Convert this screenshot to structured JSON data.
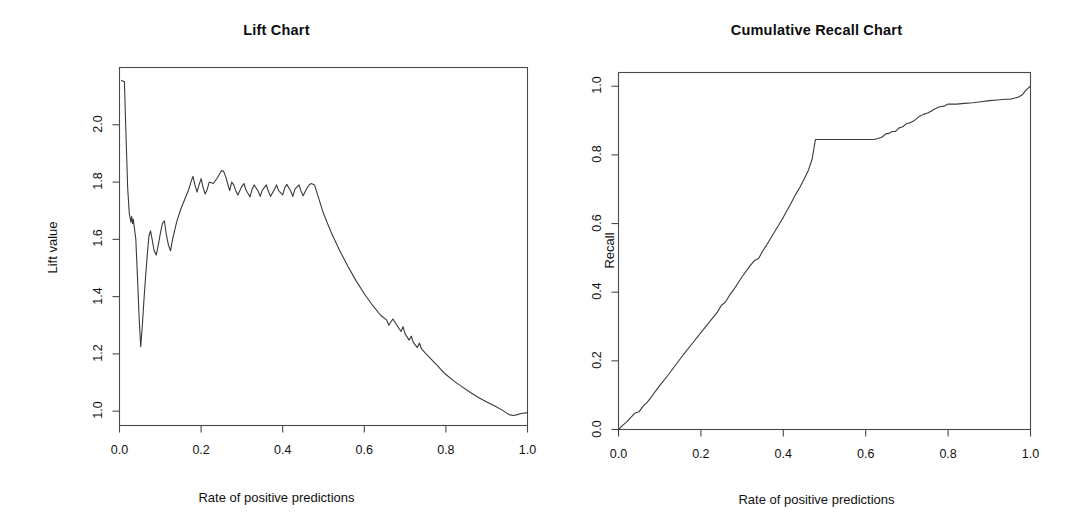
{
  "figure": {
    "background": "#ffffff",
    "line_color": "#3a3a3a",
    "axis_color": "#4a4a4a"
  },
  "chart_data": [
    {
      "type": "line",
      "id": "lift-chart",
      "title": "Lift Chart",
      "xlabel": "Rate of positive predictions",
      "ylabel": "Lift value",
      "xlim": [
        0.0,
        1.0
      ],
      "ylim": [
        0.95,
        2.2
      ],
      "grid": false,
      "legend": "none",
      "xticks": [
        0.0,
        0.2,
        0.4,
        0.6,
        0.8,
        1.0
      ],
      "xticklabels": [
        "0.0",
        "0.2",
        "0.4",
        "0.6",
        "0.8",
        "1.0"
      ],
      "yticks": [
        1.0,
        1.2,
        1.4,
        1.6,
        1.8,
        2.0
      ],
      "yticklabels": [
        "1.0",
        "1.2",
        "1.4",
        "1.6",
        "1.8",
        "2.0"
      ],
      "x": [
        0.005,
        0.012,
        0.016,
        0.02,
        0.024,
        0.028,
        0.03,
        0.032,
        0.034,
        0.036,
        0.04,
        0.044,
        0.048,
        0.052,
        0.056,
        0.06,
        0.064,
        0.068,
        0.072,
        0.076,
        0.08,
        0.085,
        0.09,
        0.095,
        0.1,
        0.105,
        0.11,
        0.115,
        0.12,
        0.125,
        0.13,
        0.14,
        0.15,
        0.16,
        0.17,
        0.175,
        0.18,
        0.185,
        0.19,
        0.195,
        0.2,
        0.205,
        0.21,
        0.215,
        0.22,
        0.23,
        0.24,
        0.25,
        0.255,
        0.26,
        0.265,
        0.27,
        0.275,
        0.28,
        0.285,
        0.29,
        0.3,
        0.305,
        0.31,
        0.32,
        0.325,
        0.33,
        0.34,
        0.345,
        0.35,
        0.36,
        0.365,
        0.37,
        0.38,
        0.385,
        0.39,
        0.4,
        0.405,
        0.41,
        0.42,
        0.425,
        0.43,
        0.44,
        0.445,
        0.45,
        0.46,
        0.465,
        0.47,
        0.478,
        0.49,
        0.5,
        0.52,
        0.54,
        0.56,
        0.58,
        0.6,
        0.62,
        0.64,
        0.655,
        0.66,
        0.67,
        0.68,
        0.69,
        0.695,
        0.7,
        0.71,
        0.715,
        0.72,
        0.73,
        0.735,
        0.74,
        0.75,
        0.76,
        0.77,
        0.78,
        0.79,
        0.8,
        0.82,
        0.84,
        0.86,
        0.88,
        0.9,
        0.92,
        0.94,
        0.955,
        0.965,
        0.975,
        0.985,
        1.0
      ],
      "y": [
        2.155,
        2.15,
        1.96,
        1.78,
        1.69,
        1.66,
        1.68,
        1.655,
        1.67,
        1.645,
        1.6,
        1.47,
        1.33,
        1.225,
        1.3,
        1.39,
        1.47,
        1.545,
        1.61,
        1.63,
        1.6,
        1.56,
        1.545,
        1.58,
        1.62,
        1.655,
        1.665,
        1.615,
        1.58,
        1.56,
        1.6,
        1.66,
        1.705,
        1.74,
        1.775,
        1.8,
        1.82,
        1.79,
        1.765,
        1.79,
        1.812,
        1.78,
        1.758,
        1.775,
        1.8,
        1.795,
        1.815,
        1.84,
        1.838,
        1.82,
        1.795,
        1.77,
        1.8,
        1.79,
        1.77,
        1.755,
        1.785,
        1.795,
        1.772,
        1.748,
        1.775,
        1.79,
        1.768,
        1.75,
        1.772,
        1.79,
        1.768,
        1.75,
        1.775,
        1.79,
        1.77,
        1.755,
        1.78,
        1.792,
        1.768,
        1.75,
        1.775,
        1.79,
        1.768,
        1.752,
        1.78,
        1.79,
        1.795,
        1.79,
        1.735,
        1.69,
        1.62,
        1.56,
        1.505,
        1.455,
        1.41,
        1.37,
        1.335,
        1.318,
        1.3,
        1.322,
        1.3,
        1.278,
        1.295,
        1.27,
        1.248,
        1.262,
        1.24,
        1.222,
        1.238,
        1.218,
        1.202,
        1.188,
        1.172,
        1.158,
        1.142,
        1.128,
        1.105,
        1.085,
        1.065,
        1.048,
        1.032,
        1.018,
        1.002,
        0.988,
        0.985,
        0.988,
        0.992,
        0.995
      ]
    },
    {
      "type": "line",
      "id": "cumulative-recall-chart",
      "title": "Cumulative Recall Chart",
      "xlabel": "Rate of positive predictions",
      "ylabel": "Recall",
      "xlim": [
        0.0,
        1.0
      ],
      "ylim": [
        0.0,
        1.04
      ],
      "grid": false,
      "legend": "none",
      "xticks": [
        0.0,
        0.2,
        0.4,
        0.6,
        0.8,
        1.0
      ],
      "xticklabels": [
        "0.0",
        "0.2",
        "0.4",
        "0.6",
        "0.8",
        "1.0"
      ],
      "yticks": [
        0.0,
        0.2,
        0.4,
        0.6,
        0.8,
        1.0
      ],
      "yticklabels": [
        "0.0",
        "0.2",
        "0.4",
        "0.6",
        "0.8",
        "1.0"
      ],
      "x": [
        0.0,
        0.01,
        0.02,
        0.03,
        0.04,
        0.05,
        0.06,
        0.07,
        0.08,
        0.09,
        0.1,
        0.12,
        0.14,
        0.16,
        0.18,
        0.2,
        0.22,
        0.24,
        0.25,
        0.26,
        0.27,
        0.28,
        0.3,
        0.32,
        0.33,
        0.34,
        0.35,
        0.36,
        0.38,
        0.39,
        0.4,
        0.41,
        0.42,
        0.43,
        0.44,
        0.45,
        0.46,
        0.47,
        0.478,
        0.5,
        0.54,
        0.58,
        0.62,
        0.63,
        0.64,
        0.65,
        0.655,
        0.665,
        0.672,
        0.68,
        0.69,
        0.7,
        0.705,
        0.715,
        0.72,
        0.73,
        0.74,
        0.75,
        0.76,
        0.765,
        0.775,
        0.78,
        0.79,
        0.8,
        0.82,
        0.84,
        0.86,
        0.88,
        0.9,
        0.92,
        0.94,
        0.95,
        0.96,
        0.97,
        0.98,
        0.99,
        1.0
      ],
      "y": [
        0.0,
        0.012,
        0.022,
        0.035,
        0.048,
        0.052,
        0.068,
        0.08,
        0.095,
        0.112,
        0.128,
        0.158,
        0.19,
        0.222,
        0.252,
        0.282,
        0.312,
        0.342,
        0.362,
        0.372,
        0.392,
        0.408,
        0.445,
        0.478,
        0.492,
        0.498,
        0.52,
        0.538,
        0.578,
        0.598,
        0.618,
        0.64,
        0.662,
        0.685,
        0.705,
        0.728,
        0.752,
        0.788,
        0.845,
        0.845,
        0.845,
        0.845,
        0.845,
        0.848,
        0.852,
        0.862,
        0.862,
        0.868,
        0.868,
        0.878,
        0.882,
        0.892,
        0.892,
        0.898,
        0.902,
        0.912,
        0.918,
        0.922,
        0.928,
        0.932,
        0.938,
        0.94,
        0.942,
        0.948,
        0.948,
        0.95,
        0.952,
        0.955,
        0.958,
        0.96,
        0.962,
        0.962,
        0.965,
        0.968,
        0.975,
        0.99,
        1.0
      ]
    }
  ]
}
